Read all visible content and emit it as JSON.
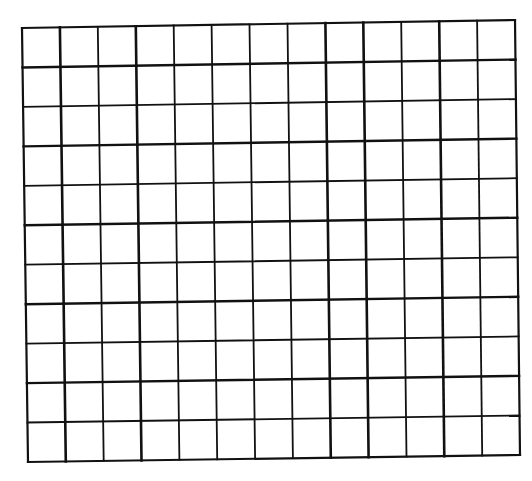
{
  "grid": {
    "columns": 13,
    "rows": 11,
    "line_color": "#111111",
    "background_color": "#ffffff",
    "corners": {
      "top_left": [
        22,
        28
      ],
      "top_right": [
        515,
        20
      ],
      "bottom_left": [
        28,
        462
      ],
      "bottom_right": [
        520,
        455
      ]
    },
    "outer_stroke_width": 2.2,
    "inner_stroke_width": 1.8,
    "heavy_vertical_lines": [
      1,
      3,
      8,
      9,
      11
    ],
    "heavy_horizontal_lines": [
      1,
      3,
      5,
      7,
      9
    ]
  }
}
